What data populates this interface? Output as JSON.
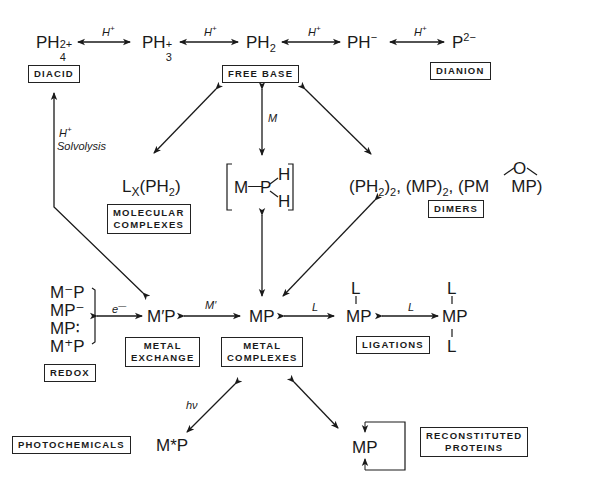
{
  "diagram": {
    "top_row": {
      "species": [
        {
          "base": "PH",
          "sub": "4",
          "sup": "2+"
        },
        {
          "base": "PH",
          "sub": "3",
          "sup": "+"
        },
        {
          "base": "PH",
          "sub": "2",
          "sup": ""
        },
        {
          "base": "PH",
          "sub": "",
          "sup": "−"
        },
        {
          "base": "P",
          "sub": "",
          "sup": "2−"
        }
      ],
      "arrow_label": "H",
      "arrow_label_sup": "+"
    },
    "category_boxes": {
      "diacid": "DIACID",
      "free_base": "FREE BASE",
      "dianion": "DIANION",
      "molecular_complexes_line1": "MOLECULAR",
      "molecular_complexes_line2": "COMPLEXES",
      "dimers": "DIMERS",
      "redox": "REDOX",
      "metal_exchange_line1": "METAL",
      "metal_exchange_line2": "EXCHANGE",
      "metal_complexes_line1": "METAL",
      "metal_complexes_line2": "COMPLEXES",
      "ligations": "LIGATIONS",
      "photochemicals": "PHOTOCHEMICALS",
      "reconstituted_proteins_line1": "RECONSTITUTED",
      "reconstituted_proteins_line2": "PROTEINS"
    },
    "reaction_labels": {
      "solvolysis_h": "H",
      "solvolysis_h_sup": "+",
      "solvolysis_text": "Solvolysis",
      "metal_insertion": "M",
      "electron": "e",
      "electron_sup": "—",
      "metal_exchange": "M′",
      "ligand_1": "L",
      "ligand_2": "L",
      "photon": "hν"
    },
    "species": {
      "molecular_complex": {
        "prefix": "L",
        "sub_x": "X",
        "mid": "(PH",
        "sub": "2",
        "end": ")"
      },
      "intermediate": {
        "m": "M",
        "bond": "—",
        "p": "P",
        "h1": "H",
        "h2": "H"
      },
      "dimers": {
        "part1": "(PH",
        "sub1": "2",
        "part1b": ")",
        "sub1b": "2",
        "sep1": ", (MP)",
        "sub2": "2",
        "sep2": ", (PM",
        "o": "O",
        "part3": "MP)"
      },
      "redox_list": [
        "M⁻P",
        "MP⁻",
        "MP∶",
        "M⁺P"
      ],
      "metal_exchange_species": "M′P",
      "metal_complex": "MP",
      "ligated_mono": {
        "top": "L",
        "mp": "MP"
      },
      "ligated_bis": {
        "top": "L",
        "mp": "MP",
        "bottom": "L"
      },
      "photoexcited": "M*P",
      "protein_mp": "MP"
    }
  }
}
